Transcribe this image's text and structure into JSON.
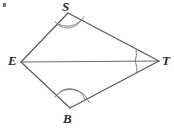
{
  "figure": {
    "kind": "geometry-diagram",
    "shape_name": "quadrilateral-ESTB",
    "background_color": "#ffffff",
    "stroke_color": "#55555a",
    "label_color": "#2b2b2b",
    "stroke_width": 1,
    "vertices": [
      {
        "id": "E",
        "label": "E",
        "x": 21,
        "y": 62,
        "label_x": 8,
        "label_y": 54
      },
      {
        "id": "S",
        "label": "S",
        "x": 68,
        "y": 13,
        "label_x": 62,
        "label_y": 0
      },
      {
        "id": "T",
        "label": "T",
        "x": 159,
        "y": 61,
        "label_x": 162,
        "label_y": 54
      },
      {
        "id": "B",
        "label": "B",
        "x": 70,
        "y": 108,
        "label_x": 63,
        "label_y": 112
      }
    ],
    "segments": [
      {
        "id": "ES",
        "from": "E",
        "to": "S",
        "style": "solid"
      },
      {
        "id": "ST",
        "from": "S",
        "to": "T",
        "style": "solid"
      },
      {
        "id": "TB",
        "from": "T",
        "to": "B",
        "style": "solid"
      },
      {
        "id": "BE",
        "from": "B",
        "to": "E",
        "style": "solid"
      },
      {
        "id": "ET",
        "from": "E",
        "to": "T",
        "style": "solid",
        "role": "diagonal"
      }
    ],
    "angle_marks": [
      {
        "id": "angle-S",
        "vertex": "S",
        "arcs": 2,
        "note": "double arc at S"
      },
      {
        "id": "angle-B",
        "vertex": "B",
        "arcs": 2,
        "note": "double arc at B"
      },
      {
        "id": "angle-T-upper",
        "vertex": "T",
        "arcs": 1,
        "note": "single arc between TS and TE"
      },
      {
        "id": "angle-T-lower",
        "vertex": "T",
        "arcs": 1,
        "note": "single arc between TE and TB"
      }
    ],
    "artifact": {
      "id": "corner-mark",
      "x": 3,
      "y": 3
    }
  }
}
